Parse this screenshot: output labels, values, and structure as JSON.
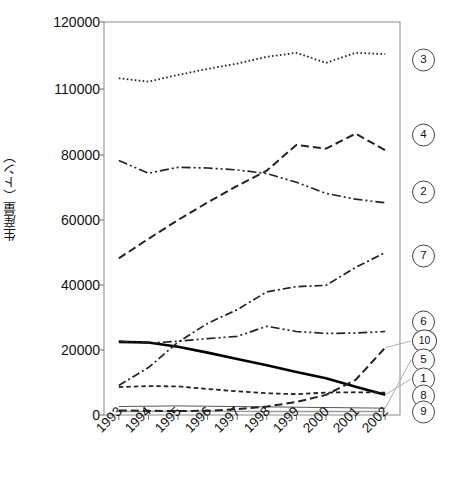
{
  "chart_data": {
    "type": "line",
    "title": "",
    "xlabel": "",
    "ylabel": "生産量（トン）",
    "categories": [
      "1993",
      "1994",
      "1995",
      "1996",
      "1997",
      "1998",
      "1999",
      "2000",
      "2001",
      "2002"
    ],
    "x_tick_labels": [
      "1993",
      "1994",
      "1995",
      "1996",
      "1997",
      "1998",
      "1999",
      "2000",
      "2001",
      "2002"
    ],
    "y_tick_labels": [
      "0",
      "20000",
      "40000",
      "60000",
      "80000",
      "110000",
      "120000"
    ],
    "y_tick_values": [
      0,
      20000,
      40000,
      60000,
      80000,
      110000,
      120000
    ],
    "axis_break": true,
    "axis_break_between": [
      80000,
      110000
    ],
    "ylim": [
      0,
      120000
    ],
    "grid": false,
    "legend_position": "right-outside",
    "series": [
      {
        "name": "1",
        "legend_label": "1",
        "style": "solid-thick",
        "color": "#000000",
        "values": [
          22500,
          22300,
          21000,
          19200,
          17200,
          15300,
          13200,
          11300,
          8700,
          6200
        ]
      },
      {
        "name": "2",
        "legend_label": "2",
        "style": "dash-dot-dot",
        "color": "#222222",
        "values": [
          78300,
          74400,
          76200,
          76000,
          75400,
          74300,
          71600,
          68200,
          66400,
          65300
        ]
      },
      {
        "name": "3",
        "legend_label": "3",
        "style": "dotted",
        "color": "#222222",
        "values": [
          111600,
          111100,
          112100,
          113000,
          113800,
          114800,
          115400,
          113900,
          115400,
          115200
        ]
      },
      {
        "name": "4",
        "legend_label": "4",
        "style": "dashed-long",
        "color": "#222222",
        "values": [
          48200,
          54200,
          60000,
          65400,
          70500,
          75200,
          84600,
          82900,
          89700,
          82200
        ]
      },
      {
        "name": "5",
        "legend_label": "5",
        "style": "solid-thin",
        "color": "#555555",
        "values": [
          2600,
          2700,
          2800,
          2700,
          2600,
          2500,
          2400,
          2300,
          2200,
          2100
        ]
      },
      {
        "name": "6",
        "legend_label": "6",
        "style": "dash-dot-dot",
        "color": "#222222",
        "values": [
          22700,
          22100,
          22700,
          23500,
          24200,
          27300,
          25700,
          25100,
          25200,
          25700
        ]
      },
      {
        "name": "7",
        "legend_label": "7",
        "style": "dash-dot",
        "color": "#222222",
        "values": [
          9100,
          14600,
          22400,
          28200,
          32400,
          37900,
          39500,
          39900,
          45400,
          50000
        ]
      },
      {
        "name": "8",
        "legend_label": "8",
        "style": "dashed-short",
        "color": "#222222",
        "values": [
          8600,
          8900,
          8800,
          8000,
          7300,
          6700,
          6400,
          6900,
          7000,
          6900
        ]
      },
      {
        "name": "9",
        "legend_label": "9",
        "style": "solid-thin-gray",
        "color": "#9a9a9a",
        "values": [
          1100,
          1100,
          1200,
          1200,
          1100,
          1100,
          1100,
          1100,
          1100,
          1100
        ]
      },
      {
        "name": "10",
        "legend_label": "10",
        "style": "dashed-long",
        "color": "#222222",
        "values": [
          1400,
          1300,
          1200,
          1300,
          1800,
          2600,
          4000,
          6200,
          10800,
          20700
        ]
      }
    ]
  },
  "legend": {
    "items": [
      {
        "label": "3"
      },
      {
        "label": "4"
      },
      {
        "label": "2"
      },
      {
        "label": "7"
      },
      {
        "label": "6"
      },
      {
        "label": "10"
      },
      {
        "label": "5"
      },
      {
        "label": "1"
      },
      {
        "label": "8"
      },
      {
        "label": "9"
      }
    ]
  }
}
